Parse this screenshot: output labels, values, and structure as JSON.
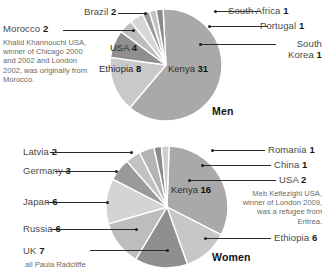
{
  "chart_data": [
    {
      "type": "pie",
      "title": "Men",
      "total": 49,
      "unit": "winners",
      "center": [
        166,
        65
      ],
      "radius": 56,
      "start_angle_deg": -93,
      "categories": [
        "Kenya",
        "Ethiopia",
        "USA",
        "Morocco",
        "Brazil",
        "South Korea",
        "Portugal",
        "South Africa"
      ],
      "values": [
        31,
        8,
        4,
        2,
        2,
        1,
        1,
        1
      ],
      "slice_colors": [
        "#a9a9a9",
        "#c9c9c9",
        "#8f8f8f",
        "#bdbdbd",
        "#d6d6d6",
        "#9a9a9a",
        "#c2c2c2",
        "#8a8a8a"
      ],
      "labels": [
        {
          "name": "Kenya",
          "text": "Kenya",
          "value": "31",
          "placement": "inside"
        },
        {
          "name": "Ethiopia",
          "text": "Ethiopia",
          "value": "8",
          "placement": "inside"
        },
        {
          "name": "USA",
          "text": "USA",
          "value": "4",
          "placement": "inside"
        },
        {
          "name": "Morocco",
          "text": "Morocco",
          "value": "2",
          "placement": "left"
        },
        {
          "name": "Brazil",
          "text": "Brazil",
          "value": "2",
          "placement": "left"
        },
        {
          "name": "South Korea",
          "text": "South Korea",
          "value": "1",
          "placement": "right"
        },
        {
          "name": "Portugal",
          "text": "Portugal",
          "value": "1",
          "placement": "right"
        },
        {
          "name": "South Africa",
          "text": "South Africa",
          "value": "1",
          "placement": "right"
        }
      ],
      "annotation": "Khalid Khannouchi USA, winner of Chicago 2000 and 2002 and London 2002, was originally from Morocco."
    },
    {
      "type": "pie",
      "title": "Women",
      "total": 50,
      "unit": "winners",
      "center": [
        167,
        207
      ],
      "radius": 61,
      "start_angle_deg": -88,
      "categories": [
        "Kenya",
        "Ethiopia",
        "UK",
        "Russia",
        "Japan",
        "Germany",
        "Latvia",
        "USA",
        "China",
        "Romania"
      ],
      "values": [
        16,
        6,
        7,
        6,
        6,
        3,
        2,
        2,
        1,
        1
      ],
      "slice_colors": [
        "#a9a9a9",
        "#c7c7c7",
        "#8f8f8f",
        "#bdbdbd",
        "#d4d4d4",
        "#9a9a9a",
        "#c2c2c2",
        "#b4b4b4",
        "#8c8c8c",
        "#cfcfcf"
      ],
      "labels": [
        {
          "name": "Kenya",
          "text": "Kenya",
          "value": "16",
          "placement": "inside"
        },
        {
          "name": "Ethiopia",
          "text": "Ethiopia",
          "value": "6",
          "placement": "right"
        },
        {
          "name": "UK",
          "text": "UK",
          "value": "7",
          "placement": "left"
        },
        {
          "name": "Russia",
          "text": "Russia",
          "value": "6",
          "placement": "left"
        },
        {
          "name": "Japan",
          "text": "Japan",
          "value": "6",
          "placement": "left"
        },
        {
          "name": "Germany",
          "text": "Germany",
          "value": "3",
          "placement": "left"
        },
        {
          "name": "Latvia",
          "text": "Latvia",
          "value": "2",
          "placement": "left"
        },
        {
          "name": "USA",
          "text": "USA",
          "value": "2",
          "placement": "right"
        },
        {
          "name": "China",
          "text": "China",
          "value": "1",
          "placement": "right"
        },
        {
          "name": "Romania",
          "text": "Romania",
          "value": "1",
          "placement": "right"
        }
      ],
      "annotation": "Meb Keflezighi USA, winner of London 2009, was a refugee from Eritrea.",
      "footnote": "all Paula Radcliffe"
    }
  ],
  "men": {
    "title": "Men",
    "annotation": "Khalid Khannouchi USA, winner of Chicago 2000 and 2002 and London 2002, was originally from Morocco.",
    "labels": {
      "kenya": "Kenya",
      "kenya_value": "31",
      "ethiopia": "Ethiopia",
      "ethiopia_value": "8",
      "usa": "USA",
      "usa_value": "4",
      "morocco": "Morocco",
      "morocco_value": "2",
      "brazil": "Brazil",
      "brazil_value": "2",
      "south_korea_line1": "South",
      "south_korea_line2": "Korea",
      "south_korea_value": "1",
      "portugal": "Portugal",
      "portugal_value": "1",
      "south_africa": "South Africa",
      "south_africa_value": "1"
    }
  },
  "women": {
    "title": "Women",
    "annotation": "Meb Keflezighi USA, winner of London 2009, was a refugee from Eritrea.",
    "footnote": "all Paula Radcliffe",
    "labels": {
      "kenya": "Kenya",
      "kenya_value": "16",
      "ethiopia": "Ethiopia",
      "ethiopia_value": "6",
      "uk": "UK",
      "uk_value": "7",
      "russia": "Russia",
      "russia_value": "6",
      "japan": "Japan",
      "japan_value": "6",
      "germany": "Germany",
      "germany_value": "3",
      "latvia": "Latvia",
      "latvia_value": "2",
      "usa": "USA",
      "usa_value": "2",
      "china": "China",
      "china_value": "1",
      "romania": "Romania",
      "romania_value": "1"
    }
  }
}
